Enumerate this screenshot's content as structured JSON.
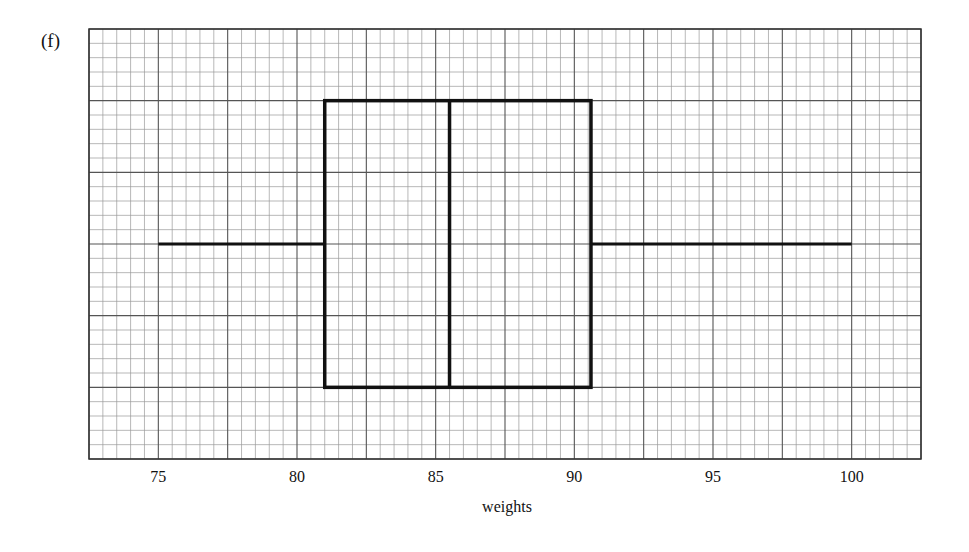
{
  "part_label": "(f)",
  "chart_data": {
    "type": "boxplot",
    "title": "",
    "xlabel": "weights",
    "ylabel": "",
    "xlim": [
      72.5,
      102.5
    ],
    "x_ticks": [
      75,
      80,
      85,
      90,
      95,
      100
    ],
    "x_tick_labels": [
      "75",
      "80",
      "85",
      "90",
      "95",
      "100"
    ],
    "grid": true,
    "grid_style": "graph paper: heavy lines every 2.5 units, light lines every 0.5 units",
    "legend": null,
    "boxplot": {
      "min": 75,
      "q1": 81,
      "median": 85.5,
      "q3": 90.6,
      "max": 100
    }
  },
  "colors": {
    "grid_major": "#555555",
    "grid_minor": "#9a9a9a",
    "box": "#111111",
    "background": "#ffffff"
  }
}
